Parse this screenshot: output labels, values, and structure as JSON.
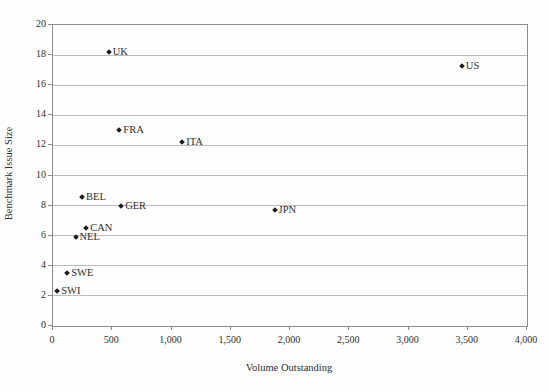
{
  "chart_data": {
    "type": "scatter",
    "title": "",
    "xlabel": "Volume Outstanding",
    "ylabel": "Benchmark Issue Size",
    "xlim": [
      0,
      4000
    ],
    "ylim": [
      0,
      20
    ],
    "x_ticks": [
      0,
      500,
      1000,
      1500,
      2000,
      2500,
      3000,
      3500,
      4000
    ],
    "x_tick_labels": [
      "0",
      "500",
      "1,000",
      "1,500",
      "2,000",
      "2,500",
      "3,000",
      "3,500",
      "4,000"
    ],
    "y_ticks": [
      0,
      2,
      4,
      6,
      8,
      10,
      12,
      14,
      16,
      18,
      20
    ],
    "y_tick_labels": [
      "0",
      "2",
      "4",
      "6",
      "8",
      "10",
      "12",
      "14",
      "16",
      "18",
      "20"
    ],
    "grid": "horizontal",
    "legend": "none",
    "marker": "diamond",
    "points": [
      {
        "label": "UK",
        "x": 470,
        "y": 18.2
      },
      {
        "label": "US",
        "x": 3450,
        "y": 17.3
      },
      {
        "label": "FRA",
        "x": 560,
        "y": 13.0
      },
      {
        "label": "ITA",
        "x": 1090,
        "y": 12.2
      },
      {
        "label": "BEL",
        "x": 245,
        "y": 8.6
      },
      {
        "label": "GER",
        "x": 575,
        "y": 8.0
      },
      {
        "label": "JPN",
        "x": 1870,
        "y": 7.7
      },
      {
        "label": "CAN",
        "x": 280,
        "y": 6.5
      },
      {
        "label": "NEL",
        "x": 190,
        "y": 5.9
      },
      {
        "label": "SWE",
        "x": 120,
        "y": 3.5
      },
      {
        "label": "SWI",
        "x": 35,
        "y": 2.3
      }
    ],
    "colors": {
      "marker": "#1c1c1c",
      "grid": "#bcbcbc",
      "axis": "#8c8c8c",
      "text": "#2e2e2e",
      "background": "#fefefe"
    }
  }
}
